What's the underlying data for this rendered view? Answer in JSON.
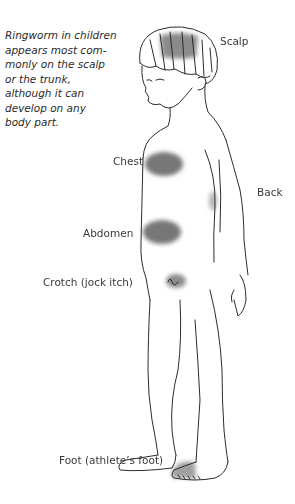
{
  "caption": {
    "lines": [
      "Ringworm in children",
      "appears most com-",
      "monly on the scalp",
      "or the trunk,",
      "although it can",
      "develop on any",
      "body part."
    ]
  },
  "labels": {
    "scalp": "Scalp",
    "chest": "Chest",
    "back": "Back",
    "abdomen": "Abdomen",
    "crotch": "Crotch (jock itch)",
    "foot": "Foot (athlete’s foot)"
  },
  "colors": {
    "lesion": "#7a7a7a",
    "outline": "#2b2b2b",
    "background": "#ffffff"
  }
}
